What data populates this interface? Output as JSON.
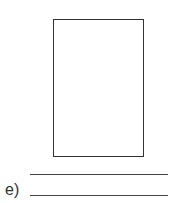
{
  "worksheet": {
    "item_label": "e)",
    "drawing_box": {
      "border_color": "#333333"
    },
    "answer_lines": 2
  }
}
